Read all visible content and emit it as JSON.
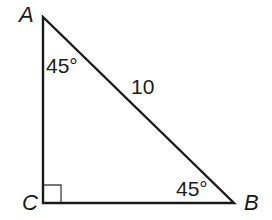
{
  "diagram": {
    "type": "right-triangle",
    "colors": {
      "stroke": "#1a1a1a",
      "background": "#ffffff"
    },
    "vertices": {
      "A": {
        "label": "A",
        "x": 43,
        "y": 17
      },
      "B": {
        "label": "B",
        "x": 234,
        "y": 203
      },
      "C": {
        "label": "C",
        "x": 43,
        "y": 203
      }
    },
    "angles": {
      "A": {
        "label": "45°"
      },
      "B": {
        "label": "45°"
      },
      "C": {
        "label": "",
        "marker": "right-angle-square"
      }
    },
    "sides": {
      "AB": {
        "label": "10"
      }
    }
  }
}
